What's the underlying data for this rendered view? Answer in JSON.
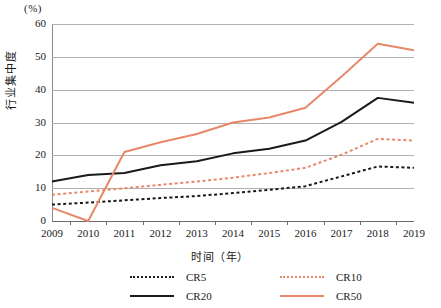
{
  "chart_data": {
    "type": "line",
    "title": "",
    "xlabel": "时间（年）",
    "ylabel": "行业集中度",
    "yunit": "(%)",
    "grid": true,
    "legend_position": "bottom",
    "xlim": [
      2009,
      2019
    ],
    "ylim": [
      0,
      60
    ],
    "yticks": [
      0,
      10,
      20,
      30,
      40,
      50,
      60
    ],
    "categories": [
      "2009",
      "2010",
      "2011",
      "2012",
      "2013",
      "2014",
      "2015",
      "2016",
      "2017",
      "2018",
      "2019"
    ],
    "series": [
      {
        "name": "CR5",
        "color": "#1a1a1a",
        "style": "dotted",
        "values": [
          5.0,
          5.6,
          6.3,
          7.0,
          7.6,
          8.5,
          9.5,
          10.6,
          13.6,
          16.6,
          16.2
        ]
      },
      {
        "name": "CR10",
        "color": "#e8886a",
        "style": "dotted",
        "values": [
          8.0,
          9.0,
          10.0,
          11.0,
          12.0,
          13.2,
          14.6,
          16.2,
          20.2,
          25.0,
          24.5
        ]
      },
      {
        "name": "CR20",
        "color": "#1a1a1a",
        "style": "solid",
        "values": [
          12.0,
          14.0,
          14.6,
          17.0,
          18.2,
          20.6,
          22.0,
          24.5,
          30.2,
          37.5,
          36.0
        ]
      },
      {
        "name": "CR50",
        "color": "#e8886a",
        "style": "solid",
        "values": [
          4.0,
          0.0,
          21.0,
          24.0,
          26.5,
          30.0,
          31.5,
          34.5,
          44.0,
          54.0,
          52.0
        ]
      }
    ]
  },
  "legend": {
    "entries": [
      {
        "label": "CR5"
      },
      {
        "label": "CR10"
      },
      {
        "label": "CR20"
      },
      {
        "label": "CR50"
      }
    ]
  }
}
